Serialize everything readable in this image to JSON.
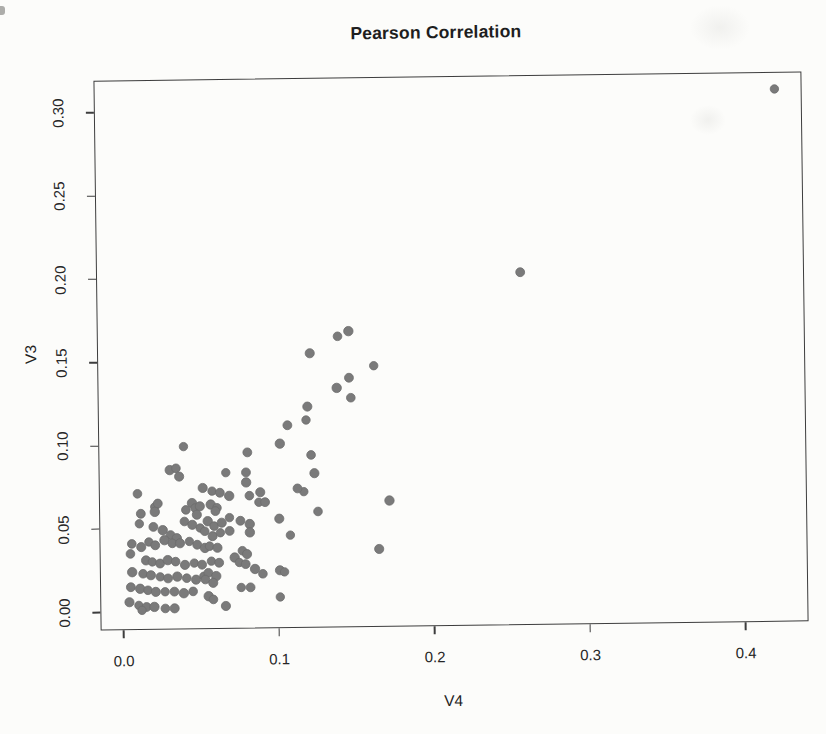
{
  "figure": {
    "title": "Pearson Correlation"
  },
  "style": {
    "background_color": "#fcfcfa",
    "axis_color": "#3d3d3d",
    "text_color": "#222222",
    "point_color": "#7a7a7a",
    "point_outline_color": "#6e6e6e"
  },
  "chart_data": {
    "type": "scatter",
    "title": "Pearson Correlation",
    "xlabel": "V4",
    "ylabel": "V3",
    "xlim": [
      -0.0148,
      0.4405
    ],
    "ylim": [
      -0.0108,
      0.3193
    ],
    "x_tick_values": [
      0.0,
      0.1,
      0.2,
      0.3,
      0.4
    ],
    "x_tick_labels": [
      "0.0",
      "0.1",
      "0.2",
      "0.3",
      "0.4"
    ],
    "y_tick_values": [
      0.0,
      0.05,
      0.1,
      0.15,
      0.2,
      0.25,
      0.3
    ],
    "y_tick_labels": [
      "0.00",
      "0.05",
      "0.10",
      "0.15",
      "0.20",
      "0.25",
      "0.30"
    ],
    "grid": false,
    "legend": "none",
    "marker": {
      "shape": "filled-circle",
      "color": "#7a7a7a",
      "diameter_px": 9
    },
    "points": [
      [
        0.423,
        0.309
      ],
      [
        0.258,
        0.201
      ],
      [
        0.147,
        0.167
      ],
      [
        0.14,
        0.164
      ],
      [
        0.122,
        0.154
      ],
      [
        0.163,
        0.146
      ],
      [
        0.147,
        0.139
      ],
      [
        0.139,
        0.133
      ],
      [
        0.148,
        0.127
      ],
      [
        0.12,
        0.122
      ],
      [
        0.119,
        0.114
      ],
      [
        0.107,
        0.111
      ],
      [
        0.102,
        0.1
      ],
      [
        0.122,
        0.093
      ],
      [
        0.124,
        0.082
      ],
      [
        0.117,
        0.071
      ],
      [
        0.113,
        0.073
      ],
      [
        0.172,
        0.065
      ],
      [
        0.126,
        0.059
      ],
      [
        0.165,
        0.036
      ],
      [
        0.04,
        0.099
      ],
      [
        0.081,
        0.095
      ],
      [
        0.031,
        0.085
      ],
      [
        0.035,
        0.086
      ],
      [
        0.037,
        0.081
      ],
      [
        0.067,
        0.083
      ],
      [
        0.08,
        0.083
      ],
      [
        0.08,
        0.077
      ],
      [
        0.01,
        0.071
      ],
      [
        0.052,
        0.074
      ],
      [
        0.058,
        0.072
      ],
      [
        0.063,
        0.071
      ],
      [
        0.069,
        0.069
      ],
      [
        0.082,
        0.069
      ],
      [
        0.089,
        0.071
      ],
      [
        0.021,
        0.063
      ],
      [
        0.023,
        0.065
      ],
      [
        0.045,
        0.065
      ],
      [
        0.047,
        0.062
      ],
      [
        0.05,
        0.063
      ],
      [
        0.088,
        0.065
      ],
      [
        0.092,
        0.065
      ],
      [
        0.057,
        0.064
      ],
      [
        0.061,
        0.062
      ],
      [
        0.101,
        0.055
      ],
      [
        0.108,
        0.045
      ],
      [
        0.012,
        0.059
      ],
      [
        0.021,
        0.06
      ],
      [
        0.041,
        0.061
      ],
      [
        0.048,
        0.058
      ],
      [
        0.011,
        0.053
      ],
      [
        0.02,
        0.051
      ],
      [
        0.026,
        0.049
      ],
      [
        0.04,
        0.054
      ],
      [
        0.045,
        0.052
      ],
      [
        0.05,
        0.05
      ],
      [
        0.031,
        0.046
      ],
      [
        0.035,
        0.044
      ],
      [
        0.006,
        0.041
      ],
      [
        0.012,
        0.039
      ],
      [
        0.017,
        0.042
      ],
      [
        0.021,
        0.04
      ],
      [
        0.027,
        0.043
      ],
      [
        0.032,
        0.041
      ],
      [
        0.037,
        0.041
      ],
      [
        0.043,
        0.042
      ],
      [
        0.048,
        0.04
      ],
      [
        0.053,
        0.038
      ],
      [
        0.005,
        0.035
      ],
      [
        0.015,
        0.031
      ],
      [
        0.019,
        0.03
      ],
      [
        0.024,
        0.029
      ],
      [
        0.029,
        0.031
      ],
      [
        0.034,
        0.03
      ],
      [
        0.04,
        0.028
      ],
      [
        0.046,
        0.029
      ],
      [
        0.051,
        0.028
      ],
      [
        0.006,
        0.024
      ],
      [
        0.013,
        0.023
      ],
      [
        0.018,
        0.022
      ],
      [
        0.024,
        0.021
      ],
      [
        0.029,
        0.02
      ],
      [
        0.035,
        0.021
      ],
      [
        0.041,
        0.02
      ],
      [
        0.047,
        0.019
      ],
      [
        0.052,
        0.021
      ],
      [
        0.005,
        0.015
      ],
      [
        0.011,
        0.014
      ],
      [
        0.016,
        0.013
      ],
      [
        0.021,
        0.012
      ],
      [
        0.027,
        0.012
      ],
      [
        0.033,
        0.012
      ],
      [
        0.039,
        0.011
      ],
      [
        0.045,
        0.012
      ],
      [
        0.004,
        0.006
      ],
      [
        0.01,
        0.004
      ],
      [
        0.015,
        0.003
      ],
      [
        0.02,
        0.003
      ],
      [
        0.027,
        0.002
      ],
      [
        0.033,
        0.002
      ],
      [
        0.012,
        0.001
      ],
      [
        0.06,
        0.06
      ],
      [
        0.055,
        0.054
      ],
      [
        0.059,
        0.051
      ],
      [
        0.064,
        0.053
      ],
      [
        0.069,
        0.056
      ],
      [
        0.076,
        0.054
      ],
      [
        0.082,
        0.052
      ],
      [
        0.053,
        0.048
      ],
      [
        0.058,
        0.045
      ],
      [
        0.063,
        0.047
      ],
      [
        0.069,
        0.048
      ],
      [
        0.082,
        0.047
      ],
      [
        0.056,
        0.039
      ],
      [
        0.061,
        0.038
      ],
      [
        0.057,
        0.03
      ],
      [
        0.062,
        0.029
      ],
      [
        0.072,
        0.032
      ],
      [
        0.077,
        0.036
      ],
      [
        0.08,
        0.034
      ],
      [
        0.075,
        0.029
      ],
      [
        0.079,
        0.028
      ],
      [
        0.085,
        0.025
      ],
      [
        0.09,
        0.022
      ],
      [
        0.101,
        0.024
      ],
      [
        0.104,
        0.023
      ],
      [
        0.055,
        0.023
      ],
      [
        0.06,
        0.021
      ],
      [
        0.053,
        0.019
      ],
      [
        0.058,
        0.017
      ],
      [
        0.076,
        0.014
      ],
      [
        0.082,
        0.014
      ],
      [
        0.055,
        0.009
      ],
      [
        0.058,
        0.007
      ],
      [
        0.066,
        0.003
      ],
      [
        0.101,
        0.008
      ]
    ]
  }
}
